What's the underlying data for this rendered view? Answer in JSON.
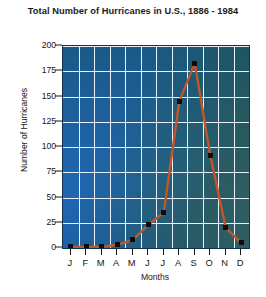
{
  "chart_data": {
    "type": "line",
    "title": "Total Number of Hurricanes in U.S., 1886 - 1984",
    "xlabel": "Months",
    "ylabel": "Number of Hurricanes",
    "categories": [
      "J",
      "F",
      "M",
      "A",
      "M",
      "J",
      "J",
      "A",
      "S",
      "O",
      "N",
      "D"
    ],
    "category_names": [
      "January",
      "February",
      "March",
      "April",
      "May",
      "June",
      "July",
      "August",
      "September",
      "October",
      "November",
      "December"
    ],
    "values": [
      1,
      1,
      1,
      3,
      8,
      23,
      35,
      145,
      183,
      92,
      20,
      5
    ],
    "ylim": [
      0,
      200
    ],
    "ytick_values": [
      0,
      25,
      50,
      75,
      100,
      125,
      150,
      175,
      200
    ],
    "ytick_labels": [
      "0",
      "25",
      "50",
      "75",
      "100",
      "125",
      "150",
      "175",
      "200"
    ],
    "grid": true,
    "legend": false,
    "series": [
      {
        "name": "Hurricanes",
        "values": [
          1,
          1,
          1,
          3,
          8,
          23,
          35,
          145,
          183,
          92,
          20,
          5
        ]
      }
    ]
  },
  "style": {
    "line_color": "#c2552a",
    "marker_color": "#0d0d0d",
    "grid_color": "#e8f1fb",
    "plot_bg_blue": "#1f66b0",
    "plot_bg_teal": "#33605c",
    "text_color": "#161616",
    "page_bg": "#ffffff"
  }
}
